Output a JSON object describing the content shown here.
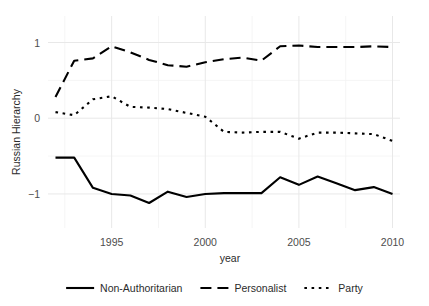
{
  "chart_data": {
    "type": "line",
    "title": "",
    "xlabel": "year",
    "ylabel": "Russian Hierarchy",
    "xlim": [
      1991.6,
      2010.4
    ],
    "ylim": [
      -1.45,
      1.35
    ],
    "xticks": [
      1995,
      2000,
      2005,
      2010
    ],
    "xtick_labels": [
      "1995",
      "2000",
      "2005",
      "2010"
    ],
    "yticks": [
      1,
      0,
      -1
    ],
    "ytick_labels": [
      "1",
      "0",
      "−1"
    ],
    "minor_yticks": [
      0.5,
      -0.5
    ],
    "minor_xticks": [
      1992.5,
      1997.5,
      2002.5,
      2007.5
    ],
    "grid": true,
    "legend_position": "bottom",
    "x": [
      1992,
      1993,
      1994,
      1995,
      1996,
      1997,
      1998,
      1999,
      2000,
      2001,
      2002,
      2003,
      2004,
      2005,
      2006,
      2007,
      2008,
      2009,
      2010
    ],
    "series": [
      {
        "name": "Non-Authoritarian",
        "style": "solid",
        "color": "#000000",
        "values": [
          -0.52,
          -0.52,
          -0.92,
          -1.0,
          -1.02,
          -1.12,
          -0.97,
          -1.04,
          -1.0,
          -0.99,
          -0.99,
          -0.99,
          -0.78,
          -0.88,
          -0.77,
          -0.86,
          -0.95,
          -0.91,
          -1.0
        ]
      },
      {
        "name": "Personalist",
        "style": "dashed",
        "color": "#000000",
        "values": [
          0.28,
          0.76,
          0.79,
          0.95,
          0.87,
          0.77,
          0.7,
          0.68,
          0.74,
          0.78,
          0.8,
          0.76,
          0.95,
          0.96,
          0.94,
          0.94,
          0.94,
          0.95,
          0.94
        ]
      },
      {
        "name": "Party",
        "style": "dotted",
        "color": "#000000",
        "values": [
          0.08,
          0.04,
          0.25,
          0.29,
          0.15,
          0.14,
          0.12,
          0.07,
          0.02,
          -0.18,
          -0.19,
          -0.18,
          -0.18,
          -0.27,
          -0.19,
          -0.19,
          -0.2,
          -0.21,
          -0.3
        ]
      }
    ]
  },
  "axes": {
    "y_title": "Russian Hierarchy",
    "x_title": "year",
    "y_tick_labels": [
      "1",
      "0",
      "−1"
    ],
    "x_tick_labels": [
      "1995",
      "2000",
      "2005",
      "2010"
    ]
  },
  "legend": {
    "items": [
      {
        "label": "Non-Authoritarian",
        "style": "solid"
      },
      {
        "label": "Personalist",
        "style": "dashed"
      },
      {
        "label": "Party",
        "style": "dotted"
      }
    ]
  },
  "colors": {
    "ink": "#000000",
    "grid_major": "#e8e8e8",
    "grid_minor": "#f2f2f2",
    "tick_text": "#4d4d4d",
    "background": "#ffffff"
  }
}
